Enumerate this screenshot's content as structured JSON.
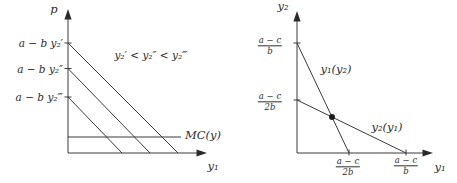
{
  "colors": {
    "background": "#ffffff",
    "line": "#3b3b3b",
    "text": "#2e2e2e",
    "dot": "#1c1c1c"
  },
  "left_figure": {
    "y_axis_label": "p",
    "x_axis_label": "y₁",
    "intercept_labels": [
      "a − b y₂′",
      "a − b y₂″",
      "a − b y₂‴"
    ],
    "annotation": "y₂′ < y₂″ < y₂‴",
    "mc_label": "MC(y)"
  },
  "right_figure": {
    "y_axis_label": "y₂",
    "x_axis_label": "y₁",
    "y_axis_fractions": [
      {
        "numerator": "a − c",
        "denominator": "b"
      },
      {
        "numerator": "a − c",
        "denominator": "2b"
      }
    ],
    "x_axis_fractions": [
      {
        "numerator": "a − c",
        "denominator": "2b"
      },
      {
        "numerator": "a − c",
        "denominator": "b"
      }
    ],
    "curve_labels": [
      "y₁(y₂)",
      "y₂(y₁)"
    ]
  }
}
